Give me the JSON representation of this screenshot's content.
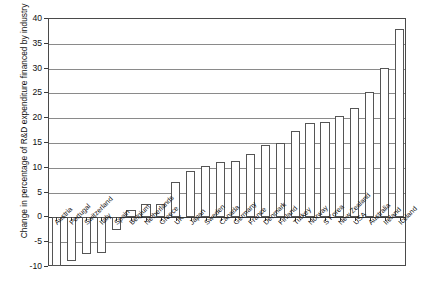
{
  "chart_data": {
    "type": "bar",
    "title": "",
    "xlabel": "",
    "ylabel": "Change in percentage of R&D expenditure financed by industry",
    "ylim": [
      -10,
      40
    ],
    "yticks": [
      -10,
      -5,
      0,
      5,
      10,
      15,
      20,
      25,
      30,
      35,
      40
    ],
    "ytick_labels": [
      "-10",
      "-5",
      "0",
      "5",
      "10",
      "15",
      "20",
      "25",
      "30",
      "35",
      "40"
    ],
    "grid": true,
    "legend": "none",
    "categories": [
      "Austria",
      "Portugal",
      "Switzerland",
      "Italy",
      "Spain",
      "Belgium",
      "Netherlands",
      "Greece",
      "UK",
      "Japan",
      "Sweden",
      "Canada",
      "Germany",
      "France",
      "Denmark",
      "Finland",
      "Turkey",
      "Norway",
      "S Korea",
      "New Zealand",
      "USA",
      "Australia",
      "Ireland",
      "Iceland"
    ],
    "values": [
      -9.7,
      -8.7,
      -7.3,
      -7.2,
      -2.5,
      1.5,
      2.7,
      2.8,
      7.2,
      9.4,
      10.4,
      11.2,
      11.3,
      12.7,
      14.6,
      15.1,
      17.4,
      19.1,
      19.2,
      20.5,
      22.1,
      25.2,
      30.1,
      38.0
    ]
  },
  "colors": {
    "bar_fill": "#ffffff",
    "bar_stroke": "#555555",
    "gridline": "#8a8a8a",
    "axis": "#4a4a4a",
    "text": "#111111",
    "background": "#ffffff"
  }
}
